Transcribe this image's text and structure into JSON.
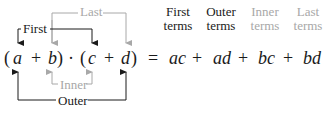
{
  "diagram": {
    "colors": {
      "dark": "#1a1a1a",
      "gray": "#a8a8a8"
    },
    "brackets": {
      "first": {
        "label": "First",
        "connects": [
          "a",
          "c"
        ],
        "color": "dark",
        "position": "above"
      },
      "last": {
        "label": "Last",
        "connects": [
          "b",
          "d"
        ],
        "color": "gray",
        "position": "above"
      },
      "inner": {
        "label": "Inner",
        "connects": [
          "b",
          "c"
        ],
        "color": "gray",
        "position": "below"
      },
      "outer": {
        "label": "Outer",
        "connects": [
          "a",
          "d"
        ],
        "color": "dark",
        "position": "below"
      }
    },
    "equation": {
      "lhs": {
        "open1": "(",
        "a": "a",
        "plus1": "+",
        "b": "b",
        "close1": ")",
        "dot": "·",
        "open2": "(",
        "c": "c",
        "plus2": "+",
        "d": "d",
        "close2": ")"
      },
      "equals": "=",
      "rhs": {
        "t1": "ac",
        "p1": "+",
        "t2": "ad",
        "p2": "+",
        "t3": "bc",
        "p3": "+",
        "t4": "bd"
      }
    },
    "headers": [
      {
        "line1": "First",
        "line2": "terms",
        "color": "dark"
      },
      {
        "line1": "Outer",
        "line2": "terms",
        "color": "dark"
      },
      {
        "line1": "Inner",
        "line2": "terms",
        "color": "gray"
      },
      {
        "line1": "Last",
        "line2": "terms",
        "color": "gray"
      }
    ]
  }
}
